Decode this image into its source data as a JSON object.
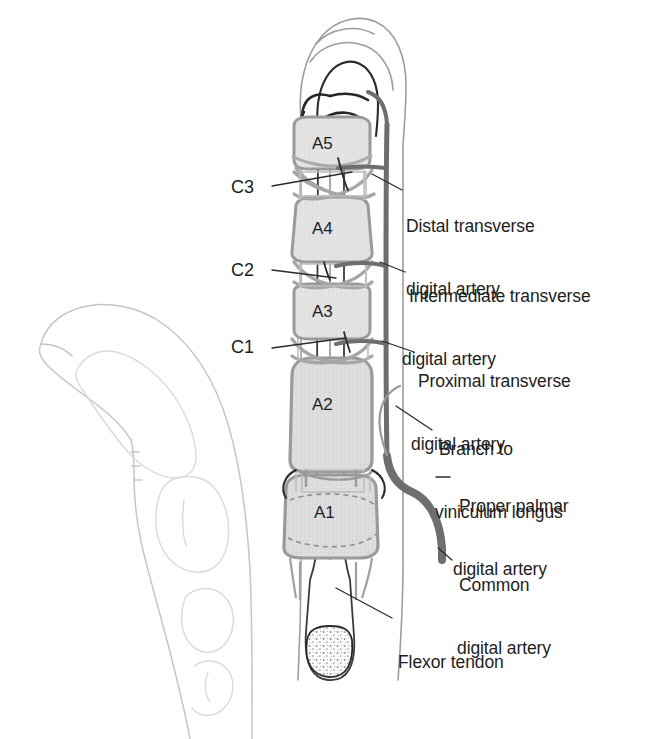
{
  "figure": {
    "view_note": "Volar view of finger with lateral outline of flexed finger at left"
  },
  "colors": {
    "outline_dark": "#2b2b2b",
    "outline_light": "#b9b9b9",
    "outline_faint": "#cfcfcf",
    "pulley_fill": "#e3e3e3",
    "pulley_stroke": "#9a9a9a",
    "artery_gray": "#6e6e6e",
    "artery_dark": "#262626",
    "text": "#1d1d1d",
    "leader_line": "#2b2b2b",
    "background": "#ffffff"
  },
  "annular_pulleys": [
    {
      "id": "A5",
      "label": "A5",
      "x": 327,
      "y": 143
    },
    {
      "id": "A4",
      "label": "A4",
      "x": 327,
      "y": 228
    },
    {
      "id": "A3",
      "label": "A3",
      "x": 327,
      "y": 311
    },
    {
      "id": "A2",
      "label": "A2",
      "x": 327,
      "y": 404
    },
    {
      "id": "A1",
      "label": "A1",
      "x": 329,
      "y": 512
    }
  ],
  "cruciate_pulleys": [
    {
      "id": "C3",
      "label": "C3",
      "x": 246,
      "y": 190
    },
    {
      "id": "C2",
      "label": "C2",
      "x": 246,
      "y": 272
    },
    {
      "id": "C1",
      "label": "C1",
      "x": 246,
      "y": 348
    }
  ],
  "callouts": [
    {
      "id": "distal-transverse-digital-artery",
      "lines": [
        "Distal transverse",
        "digital artery"
      ],
      "x": 406,
      "y": 175
    },
    {
      "id": "intermediate-transverse-digital-artery",
      "lines": [
        "Intermediate transverse",
        "digital artery"
      ],
      "x": 409,
      "y": 245
    },
    {
      "id": "proximal-transverse-digital-artery",
      "lines": [
        "Proximal transverse",
        "digital artery"
      ],
      "x": 418,
      "y": 330
    },
    {
      "id": "branch-to-viniculum-longus",
      "lines": [
        "Branch to",
        "viniculum longus"
      ],
      "x": 437,
      "y": 398
    },
    {
      "id": "proper-palmar-digital-artery",
      "lines": [
        "Proper palmar",
        "digital artery"
      ],
      "x": 456,
      "y": 455
    },
    {
      "id": "common-digital-artery",
      "lines": [
        "Common",
        "digital artery"
      ],
      "x": 457,
      "y": 534
    },
    {
      "id": "flexor-tendon",
      "lines": [
        "Flexor tendon"
      ],
      "x": 397,
      "y": 613
    }
  ]
}
